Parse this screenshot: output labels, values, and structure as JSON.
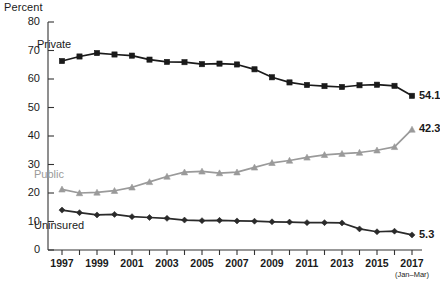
{
  "chart_data": {
    "type": "line",
    "title": "",
    "ylabel": "Percent",
    "xlabel": "",
    "ylim": [
      0,
      80
    ],
    "yticks": [
      0,
      10,
      20,
      30,
      40,
      50,
      60,
      70,
      80
    ],
    "grid": false,
    "legend_position": "inline-series-labels",
    "x": [
      "1997",
      "1998",
      "1999",
      "2000",
      "2001",
      "2002",
      "2003",
      "2004",
      "2005",
      "2006",
      "2007",
      "2008",
      "2009",
      "2010",
      "2011",
      "2012",
      "2013",
      "2014",
      "2015",
      "2016",
      "2017"
    ],
    "xtick_labels": [
      "1997",
      "1999",
      "2001",
      "2003",
      "2005",
      "2007",
      "2009",
      "2011",
      "2013",
      "2015",
      "2017"
    ],
    "xtick_sublabel": "(Jan–Mar)",
    "series": [
      {
        "name": "Private",
        "color": "#1a1a1a",
        "marker": "square",
        "label_text": "Private",
        "end_value": "54.1",
        "values": [
          66.3,
          67.9,
          69.1,
          68.6,
          68.2,
          66.8,
          66.0,
          65.9,
          65.2,
          65.4,
          65.1,
          63.4,
          60.6,
          58.8,
          57.9,
          57.5,
          57.2,
          57.8,
          58.0,
          57.6,
          54.1
        ]
      },
      {
        "name": "Public",
        "color": "#9a9a9a",
        "marker": "triangle",
        "label_text": "Public",
        "end_value": "42.3",
        "values": [
          21.3,
          20.0,
          20.2,
          20.8,
          22.0,
          23.9,
          25.8,
          27.3,
          27.6,
          27.0,
          27.3,
          29.0,
          30.6,
          31.4,
          32.5,
          33.4,
          33.8,
          34.2,
          35.0,
          36.2,
          42.3
        ]
      },
      {
        "name": "Uninsured",
        "color": "#2a2a2a",
        "marker": "diamond",
        "label_text": "Uninsured",
        "end_value": "5.3",
        "values": [
          14.0,
          13.1,
          12.3,
          12.5,
          11.7,
          11.4,
          11.1,
          10.5,
          10.3,
          10.4,
          10.2,
          10.1,
          9.9,
          9.8,
          9.6,
          9.6,
          9.5,
          7.4,
          6.4,
          6.6,
          5.3
        ]
      }
    ]
  },
  "axis": {
    "ytitle": "Percent"
  }
}
